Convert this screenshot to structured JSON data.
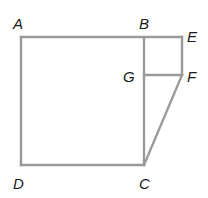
{
  "figure": {
    "type": "geometry-diagram",
    "line_color": "#9a9a9a",
    "label_color": "#1a1a1a",
    "points": {
      "A": {
        "label": "A",
        "x": 21,
        "y": 37
      },
      "B": {
        "label": "B",
        "x": 144,
        "y": 37
      },
      "E": {
        "label": "E",
        "x": 182,
        "y": 37
      },
      "G": {
        "label": "G",
        "x": 144,
        "y": 75
      },
      "F": {
        "label": "F",
        "x": 182,
        "y": 75
      },
      "D": {
        "label": "D",
        "x": 21,
        "y": 165
      },
      "C": {
        "label": "C",
        "x": 144,
        "y": 165
      }
    },
    "segments": [
      [
        "A",
        "E"
      ],
      [
        "A",
        "D"
      ],
      [
        "D",
        "C"
      ],
      [
        "B",
        "C"
      ],
      [
        "E",
        "F"
      ],
      [
        "G",
        "F"
      ],
      [
        "F",
        "C"
      ]
    ],
    "shapes": [
      {
        "name": "square ABCD",
        "vertices": [
          "A",
          "B",
          "C",
          "D"
        ]
      },
      {
        "name": "square BEFG",
        "vertices": [
          "B",
          "E",
          "F",
          "G"
        ]
      },
      {
        "name": "triangle GFC",
        "vertices": [
          "G",
          "F",
          "C"
        ]
      }
    ]
  }
}
